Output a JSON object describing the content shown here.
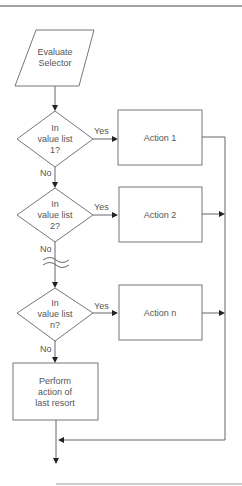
{
  "diagram": {
    "type": "flowchart",
    "title": "",
    "start": {
      "lines": [
        "Evaluate",
        "Selector"
      ]
    },
    "decisions": [
      {
        "lines": [
          "In",
          "value list",
          "1?"
        ],
        "yes_label": "Yes",
        "no_label": "No"
      },
      {
        "lines": [
          "In",
          "value list",
          "2?"
        ],
        "yes_label": "Yes",
        "no_label": "No"
      },
      {
        "lines": [
          "In",
          "value list",
          "n?"
        ],
        "yes_label": "Yes",
        "no_label": "No"
      }
    ],
    "actions": [
      {
        "label": "Action 1"
      },
      {
        "label": "Action 2"
      },
      {
        "label": "Action n"
      }
    ],
    "fallback": {
      "lines": [
        "Perform",
        "action of",
        "last resort"
      ]
    }
  },
  "colors": {
    "stroke": "#777777",
    "arrow": "#222222",
    "text": "#555555"
  }
}
